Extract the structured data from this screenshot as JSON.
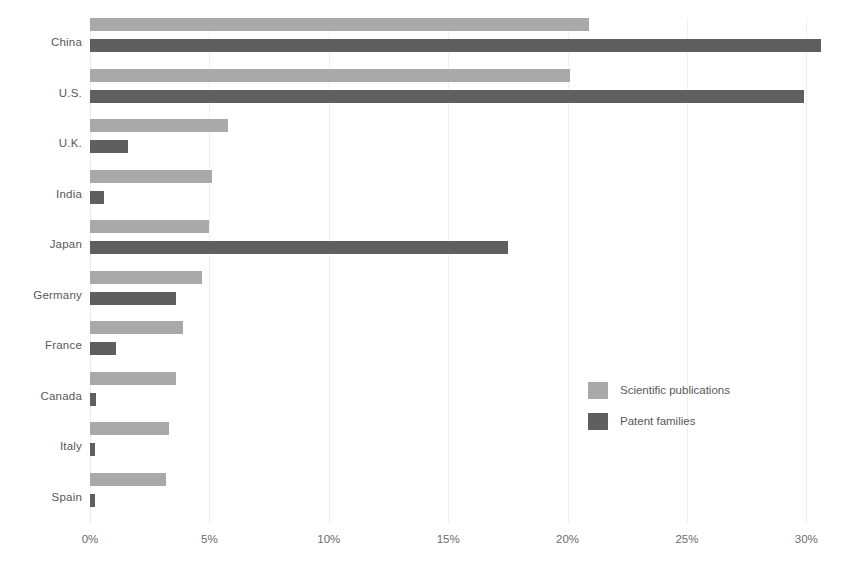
{
  "chart_data": {
    "type": "bar",
    "orientation": "horizontal",
    "title": "",
    "subtitle": "",
    "xlabel": "",
    "ylabel": "",
    "xlim": [
      0,
      31.2
    ],
    "tick_values": [
      0,
      5,
      10,
      15,
      20,
      25,
      30
    ],
    "tick_labels": [
      "0%",
      "5%",
      "10%",
      "15%",
      "20%",
      "25%",
      "30%"
    ],
    "grid": true,
    "legend_position": "middle-right",
    "categories": [
      "China",
      "U.S.",
      "U.K.",
      "India",
      "Japan",
      "Germany",
      "France",
      "Canada",
      "Italy",
      "Spain"
    ],
    "series": [
      {
        "name": "Scientific publications",
        "color": "#a9a9a9",
        "values": [
          20.9,
          20.1,
          5.8,
          5.1,
          5.0,
          4.7,
          3.9,
          3.6,
          3.3,
          3.2
        ]
      },
      {
        "name": "Patent families",
        "color": "#5f5f5f",
        "values": [
          30.6,
          29.9,
          1.6,
          0.6,
          17.5,
          3.6,
          1.1,
          0.25,
          0.2,
          0.2
        ]
      }
    ]
  },
  "legend": {
    "items": [
      {
        "label": "Scientific publications",
        "color": "#a9a9a9"
      },
      {
        "label": "Patent families",
        "color": "#5f5f5f"
      }
    ]
  },
  "axis": {
    "ticks": [
      "0%",
      "5%",
      "10%",
      "15%",
      "20%",
      "25%",
      "30%"
    ]
  },
  "categories": [
    "China",
    "U.S.",
    "U.K.",
    "India",
    "Japan",
    "Germany",
    "France",
    "Canada",
    "Italy",
    "Spain"
  ]
}
